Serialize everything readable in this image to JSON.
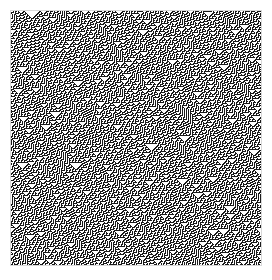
{
  "figure": {
    "kind": "cellular-automaton-raster",
    "title": "",
    "caption": ""
  },
  "canvas": {
    "page_width": 272,
    "page_height": 280,
    "background_color": "#ffffff",
    "plot_left": 10,
    "plot_top": 10,
    "plot_width": 252,
    "plot_height": 256,
    "border_color": "#d8d8d8",
    "border_width": 1
  },
  "chart_data": {
    "type": "heatmap",
    "title": "",
    "subtitle": "",
    "xlabel": "",
    "ylabel": "",
    "grid": false,
    "legend": null,
    "automaton": {
      "family": "elementary-1d",
      "rule_number": 30,
      "states": 2,
      "neighborhood": 3,
      "boundary": "periodic",
      "seed_mode": "random",
      "seed_density": 0.5,
      "rng_seed": 20240517,
      "cells_wide": 250,
      "generations": 254,
      "cell_pixel_size": 1
    },
    "colors": {
      "on": "#1a1a1a",
      "off": "#ffffff"
    },
    "xlim": [
      0,
      250
    ],
    "ylim": [
      0,
      254
    ],
    "x_tick_labels": [],
    "y_tick_labels": []
  }
}
